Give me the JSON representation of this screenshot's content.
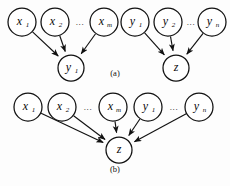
{
  "figure": {
    "background_color": "#fdfdfd",
    "stroke_color": "#111111",
    "node_fill": "#ffffff",
    "width": 230,
    "height": 186
  },
  "panels": [
    {
      "id": "a",
      "caption": "(a)",
      "caption_x": 115,
      "caption_y": 76,
      "nodes": [
        {
          "id": "a-x1",
          "name": "node-x1",
          "base": "x",
          "sub": "1",
          "cx": 22,
          "cy": 22,
          "r": 14
        },
        {
          "id": "a-x2",
          "name": "node-x2",
          "base": "x",
          "sub": "2",
          "cx": 55,
          "cy": 22,
          "r": 14
        },
        {
          "id": "a-xm",
          "name": "node-xm",
          "base": "x",
          "sub": "m",
          "cx": 104,
          "cy": 22,
          "r": 14
        },
        {
          "id": "a-y1t",
          "name": "node-y1-top",
          "base": "y",
          "sub": "1",
          "cx": 135,
          "cy": 22,
          "r": 14
        },
        {
          "id": "a-y2t",
          "name": "node-y2-top",
          "base": "y",
          "sub": "2",
          "cx": 168,
          "cy": 22,
          "r": 14
        },
        {
          "id": "a-ynt",
          "name": "node-yn-top",
          "base": "y",
          "sub": "n",
          "cx": 212,
          "cy": 22,
          "r": 14
        },
        {
          "id": "a-y1o",
          "name": "node-y1-output",
          "base": "y",
          "sub": "1",
          "cx": 71,
          "cy": 68,
          "r": 13
        },
        {
          "id": "a-zo",
          "name": "node-z-output",
          "base": "z",
          "sub": "",
          "cx": 176,
          "cy": 68,
          "r": 13
        }
      ],
      "ellipses": [
        {
          "name": "ellipsis-x-row-a",
          "text": "...",
          "x": 80,
          "y": 25
        },
        {
          "name": "ellipsis-y-row-a",
          "text": "...",
          "x": 191,
          "y": 25
        }
      ],
      "edges": [
        {
          "name": "edge-x1-to-y1",
          "from": "a-x1",
          "to": "a-y1o"
        },
        {
          "name": "edge-x2-to-y1",
          "from": "a-x2",
          "to": "a-y1o"
        },
        {
          "name": "edge-xm-to-y1",
          "from": "a-xm",
          "to": "a-y1o"
        },
        {
          "name": "edge-y1top-to-z",
          "from": "a-y1t",
          "to": "a-zo"
        },
        {
          "name": "edge-y2top-to-z",
          "from": "a-y2t",
          "to": "a-zo"
        },
        {
          "name": "edge-yntop-to-z",
          "from": "a-ynt",
          "to": "a-zo"
        }
      ]
    },
    {
      "id": "b",
      "caption": "(b)",
      "caption_x": 115,
      "caption_y": 172,
      "nodes": [
        {
          "id": "b-x1",
          "name": "node-x1",
          "base": "x",
          "sub": "1",
          "cx": 28,
          "cy": 107,
          "r": 14
        },
        {
          "id": "b-x2",
          "name": "node-x2",
          "base": "x",
          "sub": "2",
          "cx": 62,
          "cy": 107,
          "r": 14
        },
        {
          "id": "b-xm",
          "name": "node-xm",
          "base": "x",
          "sub": "m",
          "cx": 113,
          "cy": 107,
          "r": 14
        },
        {
          "id": "b-y1",
          "name": "node-y1",
          "base": "y",
          "sub": "1",
          "cx": 148,
          "cy": 107,
          "r": 14
        },
        {
          "id": "b-yn",
          "name": "node-yn",
          "base": "y",
          "sub": "n",
          "cx": 199,
          "cy": 107,
          "r": 14
        },
        {
          "id": "b-z",
          "name": "node-z-output",
          "base": "z",
          "sub": "",
          "cx": 119,
          "cy": 150,
          "r": 13
        }
      ],
      "ellipses": [
        {
          "name": "ellipsis-x-row-b",
          "text": "...",
          "x": 88,
          "y": 110
        },
        {
          "name": "ellipsis-y-row-b",
          "text": "...",
          "x": 174,
          "y": 110
        }
      ],
      "edges": [
        {
          "name": "edge-x1-to-z",
          "from": "b-x1",
          "to": "b-z"
        },
        {
          "name": "edge-x2-to-z",
          "from": "b-x2",
          "to": "b-z"
        },
        {
          "name": "edge-xm-to-z",
          "from": "b-xm",
          "to": "b-z"
        },
        {
          "name": "edge-y1-to-z",
          "from": "b-y1",
          "to": "b-z"
        },
        {
          "name": "edge-yn-to-z",
          "from": "b-yn",
          "to": "b-z"
        }
      ]
    }
  ]
}
